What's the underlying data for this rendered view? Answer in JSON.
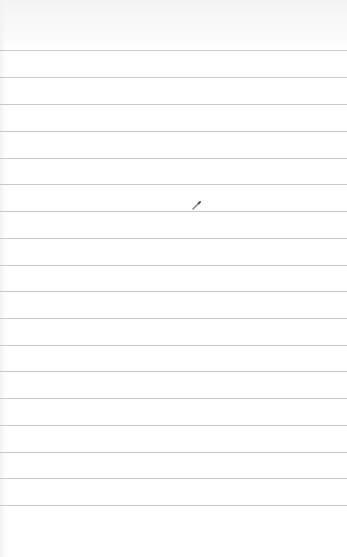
{
  "canvas": {
    "type": "lined-notepad",
    "background_color": "#fefefe",
    "rule_color": "#c9c9c9",
    "rule_count": 18,
    "rule_positions_y": [
      50,
      77,
      104,
      131,
      158,
      184,
      211,
      238,
      265,
      291,
      318,
      345,
      371,
      398,
      425,
      452,
      478,
      505
    ]
  },
  "cursor": {
    "icon": "pencil-icon",
    "x": 196,
    "y": 200
  }
}
